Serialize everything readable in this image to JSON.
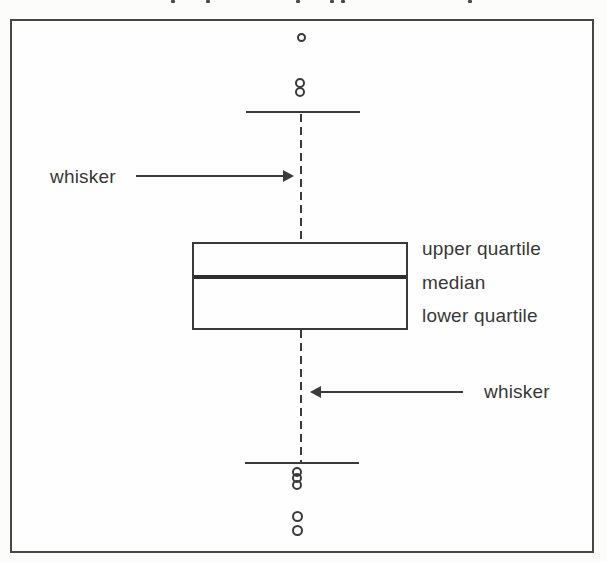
{
  "figure": {
    "type": "boxplot-anatomy-diagram",
    "annotations": {
      "upper_whisker_label": "whisker",
      "lower_whisker_label": "whisker",
      "upper_quartile_label": "upper quartile",
      "median_label": "median",
      "lower_quartile_label": "lower quartile"
    },
    "outlier_counts": {
      "above_upper_whisker": 3,
      "below_lower_whisker": 5
    },
    "colors": {
      "ink": "#3a3a3a",
      "background": "#fcfcfa",
      "box_fill": "#fefefe"
    }
  }
}
